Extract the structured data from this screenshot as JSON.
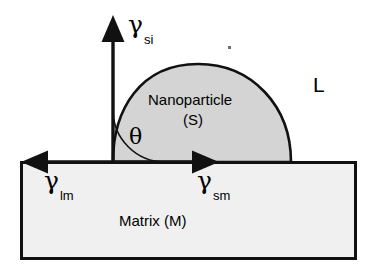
{
  "diagram": {
    "colors": {
      "stroke": "#111111",
      "particle_fill": "#d4d4d4",
      "matrix_fill": "#f0f0f0",
      "background": "#ffffff",
      "text": "#000000"
    },
    "labels": {
      "gamma_si": {
        "symbol": "γ",
        "subscript": "si"
      },
      "gamma_lm": {
        "symbol": "γ",
        "subscript": "lm"
      },
      "gamma_sm": {
        "symbol": "γ",
        "subscript": "sm"
      },
      "theta": "θ",
      "liquid_phase": "L",
      "particle_name": "Nanoparticle",
      "particle_phase": "(S)",
      "matrix_name": "Matrix (M)"
    },
    "regions": [
      {
        "name": "nanoparticle",
        "phase": "S",
        "fill": "#d4d4d4"
      },
      {
        "name": "matrix",
        "phase": "M",
        "fill": "#f0f0f0"
      },
      {
        "name": "liquid",
        "phase": "L",
        "fill": "#ffffff"
      }
    ],
    "vectors": [
      {
        "name": "gamma-si",
        "direction": "up",
        "label": "γsi"
      },
      {
        "name": "gamma-lm",
        "direction": "left",
        "label": "γlm"
      },
      {
        "name": "gamma-sm",
        "direction": "right",
        "label": "γsm"
      }
    ],
    "angle": {
      "name": "theta",
      "symbol": "θ",
      "between": [
        "gamma-si",
        "particle-surface"
      ]
    }
  }
}
